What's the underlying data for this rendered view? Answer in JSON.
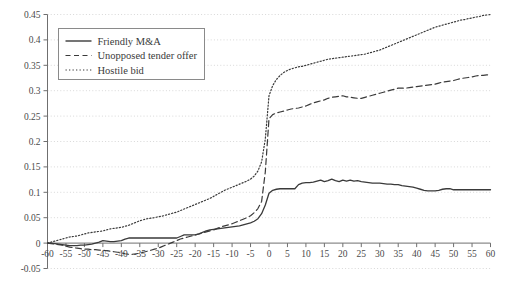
{
  "chart_data": {
    "type": "line",
    "title": "",
    "subtitle": "",
    "xlabel": "",
    "ylabel": "",
    "xlim": [
      -60,
      60
    ],
    "ylim": [
      -0.05,
      0.45
    ],
    "xticks": [
      -60,
      -55,
      -50,
      -45,
      -40,
      -35,
      -30,
      -25,
      -20,
      -15,
      -10,
      -5,
      0,
      5,
      10,
      15,
      20,
      25,
      30,
      35,
      40,
      45,
      50,
      55,
      60
    ],
    "yticks": [
      -0.05,
      0,
      0.05,
      0.1,
      0.15,
      0.2,
      0.25,
      0.3,
      0.35,
      0.4,
      0.45
    ],
    "xtick_labels": [
      "-60",
      "-55",
      "-50",
      "-45",
      "-40",
      "-35",
      "-30",
      "-25",
      "-20",
      "-15",
      "-10",
      "-5",
      "0",
      "5",
      "10",
      "15",
      "20",
      "25",
      "30",
      "35",
      "40",
      "45",
      "50",
      "55",
      "60"
    ],
    "ytick_labels": [
      "-0.05",
      "0",
      "0.05",
      "0.1",
      "0.15",
      "0.2",
      "0.25",
      "0.3",
      "0.35",
      "0.4",
      "0.45"
    ],
    "grid": true,
    "grid_axis": "y",
    "grid_style": "dotted",
    "legend_position": "top-left",
    "line_color": "#3a3a3a",
    "grid_color": "#d8d8d8",
    "axis_color": "#6f6f6f",
    "x": [
      -60,
      -59,
      -58,
      -57,
      -56,
      -55,
      -54,
      -53,
      -52,
      -51,
      -50,
      -49,
      -48,
      -47,
      -46,
      -45,
      -44,
      -43,
      -42,
      -41,
      -40,
      -39,
      -38,
      -37,
      -36,
      -35,
      -34,
      -33,
      -32,
      -31,
      -30,
      -29,
      -28,
      -27,
      -26,
      -25,
      -24,
      -23,
      -22,
      -21,
      -20,
      -19,
      -18,
      -17,
      -16,
      -15,
      -14,
      -13,
      -12,
      -11,
      -10,
      -9,
      -8,
      -7,
      -6,
      -5,
      -4,
      -3,
      -2,
      -1,
      0,
      1,
      2,
      3,
      4,
      5,
      6,
      7,
      8,
      9,
      10,
      11,
      12,
      13,
      14,
      15,
      16,
      17,
      18,
      19,
      20,
      21,
      22,
      23,
      24,
      25,
      26,
      27,
      28,
      29,
      30,
      31,
      32,
      33,
      34,
      35,
      36,
      37,
      38,
      39,
      40,
      41,
      42,
      43,
      44,
      45,
      46,
      47,
      48,
      49,
      50,
      51,
      52,
      53,
      54,
      55,
      56,
      57,
      58,
      59,
      60
    ],
    "series": [
      {
        "name": "Friendly M&A",
        "style": "solid",
        "values": [
          0.0,
          0.0,
          -0.001,
          -0.002,
          -0.003,
          -0.004,
          -0.005,
          -0.005,
          -0.005,
          -0.004,
          -0.004,
          -0.003,
          -0.002,
          0.0,
          0.002,
          0.005,
          0.004,
          0.003,
          0.003,
          0.004,
          0.005,
          0.008,
          0.01,
          0.01,
          0.01,
          0.01,
          0.01,
          0.01,
          0.01,
          0.01,
          0.01,
          0.01,
          0.01,
          0.01,
          0.01,
          0.01,
          0.013,
          0.016,
          0.016,
          0.016,
          0.016,
          0.018,
          0.021,
          0.024,
          0.026,
          0.027,
          0.028,
          0.029,
          0.03,
          0.031,
          0.032,
          0.033,
          0.034,
          0.036,
          0.038,
          0.04,
          0.043,
          0.048,
          0.058,
          0.075,
          0.098,
          0.104,
          0.106,
          0.107,
          0.107,
          0.107,
          0.107,
          0.107,
          0.115,
          0.118,
          0.119,
          0.119,
          0.12,
          0.122,
          0.124,
          0.121,
          0.123,
          0.126,
          0.123,
          0.121,
          0.124,
          0.122,
          0.124,
          0.122,
          0.123,
          0.121,
          0.12,
          0.119,
          0.118,
          0.118,
          0.118,
          0.117,
          0.116,
          0.116,
          0.115,
          0.115,
          0.113,
          0.112,
          0.111,
          0.11,
          0.108,
          0.106,
          0.104,
          0.103,
          0.103,
          0.103,
          0.104,
          0.106,
          0.107,
          0.107,
          0.105,
          0.105,
          0.105,
          0.105,
          0.105,
          0.105,
          0.105,
          0.105,
          0.105,
          0.105,
          0.105
        ]
      },
      {
        "name": "Unopposed tender offer",
        "style": "dashed",
        "values": [
          0.0,
          -0.001,
          -0.002,
          -0.003,
          -0.004,
          -0.006,
          -0.008,
          -0.009,
          -0.01,
          -0.011,
          -0.012,
          -0.012,
          -0.013,
          -0.013,
          -0.014,
          -0.014,
          -0.015,
          -0.016,
          -0.017,
          -0.018,
          -0.019,
          -0.021,
          -0.022,
          -0.022,
          -0.021,
          -0.02,
          -0.018,
          -0.016,
          -0.014,
          -0.012,
          -0.01,
          -0.007,
          -0.004,
          -0.001,
          0.002,
          0.005,
          0.008,
          0.01,
          0.012,
          0.014,
          0.016,
          0.018,
          0.02,
          0.022,
          0.024,
          0.026,
          0.029,
          0.032,
          0.034,
          0.036,
          0.038,
          0.041,
          0.044,
          0.047,
          0.05,
          0.054,
          0.06,
          0.068,
          0.082,
          0.14,
          0.245,
          0.253,
          0.256,
          0.258,
          0.26,
          0.262,
          0.264,
          0.265,
          0.266,
          0.268,
          0.27,
          0.273,
          0.276,
          0.278,
          0.28,
          0.282,
          0.285,
          0.287,
          0.288,
          0.289,
          0.29,
          0.288,
          0.287,
          0.286,
          0.285,
          0.285,
          0.287,
          0.289,
          0.291,
          0.293,
          0.295,
          0.297,
          0.299,
          0.301,
          0.303,
          0.305,
          0.305,
          0.305,
          0.306,
          0.307,
          0.308,
          0.309,
          0.31,
          0.311,
          0.312,
          0.313,
          0.315,
          0.317,
          0.318,
          0.319,
          0.32,
          0.322,
          0.324,
          0.325,
          0.326,
          0.327,
          0.329,
          0.33,
          0.33,
          0.331,
          0.332
        ]
      },
      {
        "name": "Hostile bid",
        "style": "dotted",
        "values": [
          0.0,
          0.002,
          0.004,
          0.006,
          0.008,
          0.01,
          0.012,
          0.013,
          0.014,
          0.016,
          0.018,
          0.02,
          0.021,
          0.022,
          0.023,
          0.024,
          0.026,
          0.028,
          0.029,
          0.03,
          0.031,
          0.033,
          0.035,
          0.038,
          0.041,
          0.044,
          0.046,
          0.048,
          0.049,
          0.05,
          0.052,
          0.053,
          0.055,
          0.057,
          0.059,
          0.061,
          0.064,
          0.067,
          0.07,
          0.073,
          0.076,
          0.079,
          0.082,
          0.085,
          0.088,
          0.092,
          0.096,
          0.1,
          0.104,
          0.107,
          0.11,
          0.113,
          0.116,
          0.119,
          0.122,
          0.126,
          0.132,
          0.142,
          0.16,
          0.205,
          0.29,
          0.31,
          0.322,
          0.33,
          0.336,
          0.34,
          0.343,
          0.345,
          0.347,
          0.348,
          0.35,
          0.352,
          0.354,
          0.356,
          0.358,
          0.36,
          0.362,
          0.363,
          0.364,
          0.365,
          0.366,
          0.367,
          0.368,
          0.369,
          0.37,
          0.371,
          0.372,
          0.374,
          0.376,
          0.378,
          0.38,
          0.383,
          0.386,
          0.389,
          0.392,
          0.395,
          0.398,
          0.401,
          0.404,
          0.407,
          0.41,
          0.413,
          0.416,
          0.419,
          0.422,
          0.425,
          0.427,
          0.429,
          0.431,
          0.433,
          0.435,
          0.437,
          0.439,
          0.44,
          0.442,
          0.443,
          0.445,
          0.446,
          0.448,
          0.449,
          0.45
        ]
      }
    ]
  },
  "legend": {
    "items": [
      {
        "label": "Friendly M&A",
        "style": "solid"
      },
      {
        "label": "Unopposed tender offer",
        "style": "dashed"
      },
      {
        "label": "Hostile bid",
        "style": "dotted"
      }
    ]
  }
}
